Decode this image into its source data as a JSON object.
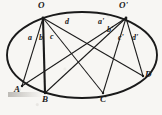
{
  "figure": {
    "background_color": "#f7f6f3",
    "ink_color": "#1a1a1a",
    "conic": {
      "shape": "ellipse",
      "center_x": 82,
      "center_y": 55,
      "radius_x": 75,
      "radius_y": 43,
      "rotation_deg": 0
    },
    "points": [
      {
        "id": "O",
        "label": "O",
        "x": 43,
        "y": 18,
        "label_x": 38,
        "label_y": 2,
        "label_pos": "above"
      },
      {
        "id": "Op",
        "label": "O'",
        "x": 126,
        "y": 18,
        "label_x": 120,
        "label_y": 2,
        "label_pos": "above"
      },
      {
        "id": "A",
        "label": "A",
        "x": 22,
        "y": 86,
        "label_x": 15,
        "label_y": 88,
        "label_pos": "below-left"
      },
      {
        "id": "B",
        "label": "B",
        "x": 45,
        "y": 93,
        "label_x": 42,
        "label_y": 97,
        "label_pos": "below"
      },
      {
        "id": "C",
        "label": "C",
        "x": 103,
        "y": 93,
        "label_x": 100,
        "label_y": 97,
        "label_pos": "below"
      },
      {
        "id": "D",
        "label": "D",
        "x": 143,
        "y": 76,
        "label_x": 145,
        "label_y": 72,
        "label_pos": "right"
      }
    ],
    "segments": [
      {
        "id": "OA",
        "from": "O",
        "to": "A",
        "label": "a",
        "label_x": 29,
        "label_y": 36
      },
      {
        "id": "OB",
        "from": "O",
        "to": "B",
        "label": "b",
        "label_x": 40,
        "label_y": 36
      },
      {
        "id": "OC",
        "from": "O",
        "to": "C",
        "label": "c",
        "label_x": 51,
        "label_y": 35
      },
      {
        "id": "OD",
        "from": "O",
        "to": "D",
        "label": "d",
        "label_x": 66,
        "label_y": 20
      },
      {
        "id": "OpA",
        "from": "Op",
        "to": "A",
        "label": "a'",
        "label_x": 99,
        "label_y": 20
      },
      {
        "id": "OpB",
        "from": "Op",
        "to": "B",
        "label": "b'",
        "label_x": 108,
        "label_y": 28
      },
      {
        "id": "OpC",
        "from": "Op",
        "to": "C",
        "label": "c'",
        "label_x": 119,
        "label_y": 36
      },
      {
        "id": "OpD",
        "from": "Op",
        "to": "D",
        "label": "d'",
        "label_x": 133,
        "label_y": 36
      }
    ],
    "chord_OB_emphasis": "thick"
  }
}
